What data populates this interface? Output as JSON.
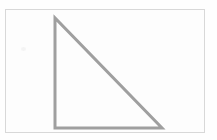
{
  "canvas": {
    "width": 217,
    "height": 140,
    "background_color": "#fefefe",
    "title": "Right triangle figure"
  },
  "frame": {
    "label": "figure border",
    "x": 5,
    "y": 9,
    "width": 200,
    "height": 124,
    "border_color": "#d8d8d8",
    "fill_color": "#fdfdfd"
  },
  "figure": {
    "name": "right-triangle",
    "stroke_color": "#9a9a9a",
    "stroke_width": 3,
    "fill": "none",
    "vertices": [
      {
        "label": "apex",
        "x": 55,
        "y": 18
      },
      {
        "label": "right-angle",
        "x": 55,
        "y": 128
      },
      {
        "label": "base-right",
        "x": 162,
        "y": 128
      }
    ],
    "edges": [
      {
        "label": "vertical-leg",
        "from": "apex",
        "to": "right-angle"
      },
      {
        "label": "horizontal-leg",
        "from": "right-angle",
        "to": "base-right"
      },
      {
        "label": "hypotenuse",
        "from": "base-right",
        "to": "apex"
      }
    ]
  },
  "artifacts": [
    {
      "label": "scan-speck",
      "x": 21,
      "y": 47
    }
  ]
}
